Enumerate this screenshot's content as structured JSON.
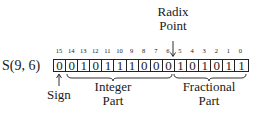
{
  "diagram": {
    "format_label": "S(9, 6)",
    "radix_point_label": [
      "Radix",
      "Point"
    ],
    "bit_indices": [
      "15",
      "14",
      "13",
      "12",
      "11",
      "10",
      "9",
      "8",
      "7",
      "6",
      "5",
      "4",
      "3",
      "2",
      "1",
      "0"
    ],
    "bits": [
      "0",
      "0",
      "1",
      "0",
      "1",
      "1",
      "1",
      "0",
      "0",
      "0",
      "1",
      "0",
      "1",
      "0",
      "1",
      "1"
    ],
    "sign_label": "Sign",
    "integer_part_label": [
      "Integer",
      "Part"
    ],
    "fractional_part_label": [
      "Fractional",
      "Part"
    ],
    "colors": {
      "ink": "#1a1a1a",
      "background": "#ffffff"
    }
  }
}
